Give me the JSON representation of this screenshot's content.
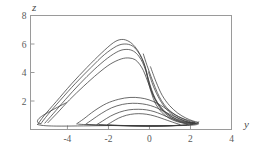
{
  "chart_data": {
    "type": "line",
    "title": "",
    "subtitle": "",
    "xlabel": "y",
    "ylabel": "z",
    "xlim": [
      -5.8,
      4.0
    ],
    "ylim": [
      0.0,
      8.0
    ],
    "grid": false,
    "legend": null,
    "xticks": [
      -4,
      -2,
      0,
      2,
      4
    ],
    "xtick_labels": [
      "-4",
      "-2",
      "0",
      "2",
      "4"
    ],
    "yticks": [
      2,
      4,
      6,
      8
    ],
    "ytick_labels": [
      "2",
      "4",
      "6",
      "8"
    ],
    "line_color": "#3a3a3a",
    "frame_color": "#9a9a9a",
    "series": [
      {
        "name": "trajectory-outer-arc-1",
        "points": [
          [
            -5.45,
            0.35
          ],
          [
            -5.15,
            0.95
          ],
          [
            -4.55,
            1.95
          ],
          [
            -3.8,
            3.2
          ],
          [
            -3.05,
            4.35
          ],
          [
            -2.35,
            5.35
          ],
          [
            -1.75,
            6.1
          ],
          [
            -1.35,
            6.32
          ],
          [
            -1.0,
            6.18
          ],
          [
            -0.7,
            5.8
          ],
          [
            -0.45,
            5.25
          ],
          [
            -0.28,
            4.7
          ],
          [
            -0.15,
            4.05
          ],
          [
            -0.05,
            3.3
          ],
          [
            0.1,
            2.55
          ],
          [
            0.3,
            1.8
          ],
          [
            0.6,
            1.2
          ],
          [
            0.95,
            0.8
          ],
          [
            1.35,
            0.55
          ],
          [
            1.75,
            0.42
          ],
          [
            2.1,
            0.38
          ],
          [
            2.35,
            0.42
          ],
          [
            2.4,
            0.55
          ]
        ]
      },
      {
        "name": "trajectory-outer-arc-2",
        "points": [
          [
            -5.3,
            0.4
          ],
          [
            -4.95,
            1.05
          ],
          [
            -4.35,
            2.05
          ],
          [
            -3.6,
            3.25
          ],
          [
            -2.85,
            4.35
          ],
          [
            -2.2,
            5.25
          ],
          [
            -1.6,
            5.85
          ],
          [
            -1.2,
            6.0
          ],
          [
            -0.85,
            5.88
          ],
          [
            -0.58,
            5.5
          ],
          [
            -0.38,
            5.0
          ],
          [
            -0.22,
            4.45
          ],
          [
            -0.1,
            3.8
          ],
          [
            0.02,
            3.1
          ],
          [
            0.18,
            2.4
          ],
          [
            0.42,
            1.72
          ],
          [
            0.72,
            1.18
          ],
          [
            1.08,
            0.8
          ],
          [
            1.48,
            0.56
          ],
          [
            1.88,
            0.44
          ],
          [
            2.18,
            0.42
          ],
          [
            2.35,
            0.5
          ]
        ]
      },
      {
        "name": "trajectory-outer-arc-3",
        "points": [
          [
            -5.1,
            0.45
          ],
          [
            -4.7,
            1.1
          ],
          [
            -4.1,
            2.1
          ],
          [
            -3.4,
            3.2
          ],
          [
            -2.7,
            4.2
          ],
          [
            -2.05,
            5.0
          ],
          [
            -1.5,
            5.5
          ],
          [
            -1.1,
            5.62
          ],
          [
            -0.78,
            5.5
          ],
          [
            -0.52,
            5.15
          ],
          [
            -0.33,
            4.68
          ],
          [
            -0.18,
            4.12
          ],
          [
            -0.05,
            3.5
          ],
          [
            0.1,
            2.82
          ],
          [
            0.28,
            2.18
          ],
          [
            0.52,
            1.6
          ],
          [
            0.84,
            1.12
          ],
          [
            1.2,
            0.78
          ],
          [
            1.58,
            0.56
          ],
          [
            1.95,
            0.46
          ],
          [
            2.2,
            0.46
          ]
        ]
      },
      {
        "name": "trajectory-outer-arc-4",
        "points": [
          [
            -4.95,
            0.48
          ],
          [
            -4.5,
            1.15
          ],
          [
            -3.9,
            2.08
          ],
          [
            -3.2,
            3.05
          ],
          [
            -2.52,
            3.92
          ],
          [
            -1.92,
            4.58
          ],
          [
            -1.38,
            4.95
          ],
          [
            -1.0,
            5.02
          ],
          [
            -0.7,
            4.9
          ],
          [
            -0.48,
            4.58
          ],
          [
            -0.3,
            4.15
          ],
          [
            -0.15,
            3.62
          ],
          [
            0.0,
            3.05
          ],
          [
            0.16,
            2.45
          ],
          [
            0.38,
            1.9
          ],
          [
            0.64,
            1.42
          ],
          [
            0.96,
            1.02
          ],
          [
            1.32,
            0.74
          ],
          [
            1.7,
            0.56
          ],
          [
            2.02,
            0.48
          ],
          [
            2.22,
            0.5
          ]
        ]
      },
      {
        "name": "trajectory-inner-loop-1",
        "points": [
          [
            -3.55,
            0.4
          ],
          [
            -3.2,
            0.75
          ],
          [
            -2.7,
            1.3
          ],
          [
            -2.1,
            1.82
          ],
          [
            -1.5,
            2.12
          ],
          [
            -0.95,
            2.25
          ],
          [
            -0.45,
            2.22
          ],
          [
            -0.02,
            2.08
          ],
          [
            0.35,
            1.85
          ],
          [
            0.68,
            1.58
          ],
          [
            0.98,
            1.28
          ],
          [
            1.28,
            1.0
          ],
          [
            1.58,
            0.78
          ],
          [
            1.88,
            0.6
          ],
          [
            2.12,
            0.48
          ],
          [
            2.28,
            0.42
          ],
          [
            2.2,
            0.38
          ],
          [
            1.85,
            0.32
          ],
          [
            1.35,
            0.28
          ],
          [
            0.7,
            0.25
          ],
          [
            0.0,
            0.24
          ],
          [
            -0.7,
            0.26
          ],
          [
            -1.4,
            0.28
          ],
          [
            -2.05,
            0.3
          ],
          [
            -2.7,
            0.32
          ],
          [
            -3.2,
            0.35
          ],
          [
            -3.5,
            0.38
          ]
        ]
      },
      {
        "name": "trajectory-inner-loop-2",
        "points": [
          [
            -3.1,
            0.38
          ],
          [
            -2.8,
            0.68
          ],
          [
            -2.35,
            1.12
          ],
          [
            -1.85,
            1.52
          ],
          [
            -1.32,
            1.76
          ],
          [
            -0.82,
            1.84
          ],
          [
            -0.35,
            1.8
          ],
          [
            0.05,
            1.68
          ],
          [
            0.42,
            1.48
          ],
          [
            0.76,
            1.24
          ],
          [
            1.08,
            1.0
          ],
          [
            1.4,
            0.78
          ],
          [
            1.7,
            0.6
          ],
          [
            1.96,
            0.48
          ],
          [
            2.12,
            0.4
          ],
          [
            2.02,
            0.34
          ],
          [
            1.65,
            0.3
          ],
          [
            1.15,
            0.27
          ],
          [
            0.5,
            0.25
          ],
          [
            -0.2,
            0.24
          ],
          [
            -0.9,
            0.25
          ],
          [
            -1.6,
            0.27
          ],
          [
            -2.2,
            0.3
          ],
          [
            -2.75,
            0.33
          ],
          [
            -3.05,
            0.36
          ]
        ]
      },
      {
        "name": "trajectory-inner-loop-3",
        "points": [
          [
            -2.55,
            0.36
          ],
          [
            -2.28,
            0.6
          ],
          [
            -1.9,
            0.94
          ],
          [
            -1.45,
            1.22
          ],
          [
            -1.0,
            1.38
          ],
          [
            -0.55,
            1.42
          ],
          [
            -0.15,
            1.38
          ],
          [
            0.22,
            1.26
          ],
          [
            0.56,
            1.08
          ],
          [
            0.88,
            0.88
          ],
          [
            1.18,
            0.7
          ],
          [
            1.46,
            0.55
          ],
          [
            1.7,
            0.44
          ],
          [
            1.86,
            0.37
          ],
          [
            1.76,
            0.32
          ],
          [
            1.4,
            0.29
          ],
          [
            0.92,
            0.26
          ],
          [
            0.32,
            0.25
          ],
          [
            -0.32,
            0.25
          ],
          [
            -0.95,
            0.26
          ],
          [
            -1.55,
            0.28
          ],
          [
            -2.1,
            0.31
          ],
          [
            -2.45,
            0.34
          ]
        ]
      },
      {
        "name": "trajectory-inner-loop-4",
        "points": [
          [
            -2.05,
            0.34
          ],
          [
            -1.82,
            0.54
          ],
          [
            -1.5,
            0.8
          ],
          [
            -1.12,
            1.0
          ],
          [
            -0.72,
            1.1
          ],
          [
            -0.32,
            1.1
          ],
          [
            0.05,
            1.02
          ],
          [
            0.4,
            0.88
          ],
          [
            0.72,
            0.72
          ],
          [
            1.0,
            0.58
          ],
          [
            1.24,
            0.46
          ],
          [
            1.42,
            0.38
          ],
          [
            1.5,
            0.33
          ],
          [
            1.32,
            0.29
          ],
          [
            0.95,
            0.27
          ],
          [
            0.45,
            0.25
          ],
          [
            -0.1,
            0.25
          ],
          [
            -0.65,
            0.26
          ],
          [
            -1.2,
            0.28
          ],
          [
            -1.7,
            0.3
          ],
          [
            -1.98,
            0.32
          ]
        ]
      },
      {
        "name": "trajectory-left-spiral-1",
        "points": [
          [
            -5.45,
            0.35
          ],
          [
            -5.3,
            0.3
          ],
          [
            -5.0,
            0.26
          ],
          [
            -4.55,
            0.24
          ],
          [
            -4.05,
            0.24
          ],
          [
            -3.5,
            0.25
          ],
          [
            -2.9,
            0.26
          ],
          [
            -2.3,
            0.27
          ],
          [
            -1.7,
            0.28
          ],
          [
            -1.1,
            0.28
          ],
          [
            -0.5,
            0.27
          ],
          [
            0.1,
            0.26
          ],
          [
            0.7,
            0.26
          ],
          [
            1.3,
            0.27
          ],
          [
            1.85,
            0.29
          ],
          [
            2.25,
            0.33
          ],
          [
            2.4,
            0.4
          ]
        ]
      },
      {
        "name": "trajectory-left-spiral-2",
        "points": [
          [
            -5.3,
            0.4
          ],
          [
            -5.45,
            0.5
          ],
          [
            -5.42,
            0.72
          ],
          [
            -5.2,
            0.98
          ],
          [
            -4.88,
            1.25
          ],
          [
            -4.5,
            1.55
          ],
          [
            -4.05,
            1.88
          ]
        ]
      },
      {
        "name": "trajectory-descent-1",
        "points": [
          [
            -0.05,
            4.05
          ],
          [
            0.2,
            3.0
          ],
          [
            0.5,
            2.1
          ],
          [
            0.85,
            1.4
          ],
          [
            1.25,
            0.92
          ],
          [
            1.7,
            0.62
          ],
          [
            2.1,
            0.46
          ],
          [
            2.38,
            0.44
          ]
        ]
      },
      {
        "name": "trajectory-descent-2",
        "points": [
          [
            0.05,
            4.4
          ],
          [
            0.32,
            3.35
          ],
          [
            0.62,
            2.4
          ],
          [
            0.98,
            1.68
          ],
          [
            1.38,
            1.15
          ],
          [
            1.78,
            0.8
          ],
          [
            2.12,
            0.6
          ],
          [
            2.34,
            0.52
          ]
        ]
      },
      {
        "name": "trajectory-crossover",
        "points": [
          [
            -0.3,
            5.3
          ],
          [
            -0.12,
            4.5
          ],
          [
            0.08,
            3.7
          ],
          [
            0.28,
            2.95
          ],
          [
            0.48,
            2.3
          ],
          [
            0.7,
            1.78
          ],
          [
            0.96,
            1.36
          ],
          [
            1.26,
            1.04
          ],
          [
            1.58,
            0.8
          ],
          [
            1.9,
            0.64
          ],
          [
            2.18,
            0.54
          ]
        ]
      }
    ]
  }
}
